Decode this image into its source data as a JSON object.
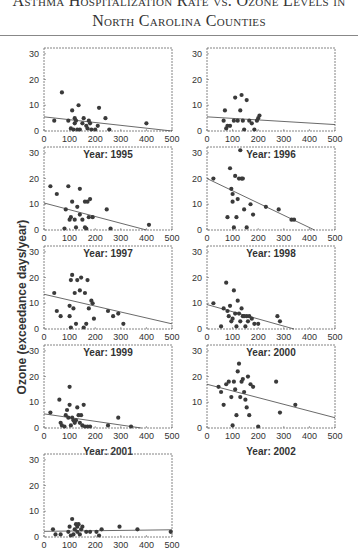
{
  "header": {
    "title_line1": "Asthma Hospitalization Rate vs. Ozone Levels in",
    "title_line2": "North Carolina Counties"
  },
  "y_axis_label": "Ozone (exceedance days/year)",
  "chart_data": [
    {
      "type": "scatter",
      "title": "Year: 1995",
      "xlim": [
        0,
        500
      ],
      "ylim": [
        0,
        30
      ],
      "xticks": [
        0,
        100,
        200,
        300,
        400,
        500
      ],
      "yticks": [
        0,
        10,
        20,
        30
      ],
      "points": [
        [
          40,
          4
        ],
        [
          70,
          15
        ],
        [
          95,
          4
        ],
        [
          105,
          1
        ],
        [
          110,
          8
        ],
        [
          115,
          0
        ],
        [
          120,
          3
        ],
        [
          120,
          5
        ],
        [
          125,
          4
        ],
        [
          130,
          0
        ],
        [
          135,
          10
        ],
        [
          140,
          0
        ],
        [
          150,
          3
        ],
        [
          155,
          5
        ],
        [
          165,
          2
        ],
        [
          170,
          1
        ],
        [
          175,
          4
        ],
        [
          180,
          3
        ],
        [
          185,
          0
        ],
        [
          200,
          0
        ],
        [
          210,
          2
        ],
        [
          215,
          9
        ],
        [
          240,
          5
        ],
        [
          255,
          0
        ],
        [
          400,
          3
        ]
      ],
      "trend": [
        [
          0,
          5.5
        ],
        [
          500,
          0
        ]
      ]
    },
    {
      "type": "scatter",
      "title": "Year: 1996",
      "xlim": [
        0,
        500
      ],
      "ylim": [
        0,
        30
      ],
      "xticks": [
        0,
        100,
        200,
        300,
        400,
        500
      ],
      "yticks": [
        0,
        10,
        20,
        30
      ],
      "points": [
        [
          65,
          4
        ],
        [
          70,
          8
        ],
        [
          75,
          1
        ],
        [
          80,
          2
        ],
        [
          90,
          2
        ],
        [
          105,
          4
        ],
        [
          110,
          13
        ],
        [
          120,
          4
        ],
        [
          130,
          8
        ],
        [
          135,
          14
        ],
        [
          140,
          4
        ],
        [
          145,
          0
        ],
        [
          155,
          12
        ],
        [
          165,
          4
        ],
        [
          175,
          3
        ],
        [
          185,
          0
        ],
        [
          195,
          4
        ],
        [
          200,
          5
        ],
        [
          205,
          6
        ]
      ],
      "trend": [
        [
          0,
          5.5
        ],
        [
          500,
          2.5
        ]
      ]
    },
    {
      "type": "scatter",
      "title": "Year: 1997",
      "xlim": [
        0,
        500
      ],
      "ylim": [
        0,
        30
      ],
      "xticks": [
        0,
        100,
        200,
        300,
        400,
        500
      ],
      "yticks": [
        0,
        10,
        20,
        30
      ],
      "points": [
        [
          25,
          17
        ],
        [
          50,
          14
        ],
        [
          80,
          0
        ],
        [
          85,
          8
        ],
        [
          95,
          17
        ],
        [
          100,
          4
        ],
        [
          105,
          5
        ],
        [
          110,
          11
        ],
        [
          120,
          4
        ],
        [
          125,
          1
        ],
        [
          130,
          9
        ],
        [
          140,
          6
        ],
        [
          140,
          16
        ],
        [
          150,
          4
        ],
        [
          160,
          1
        ],
        [
          160,
          11
        ],
        [
          165,
          0
        ],
        [
          170,
          11
        ],
        [
          175,
          5
        ],
        [
          180,
          12
        ],
        [
          190,
          5
        ],
        [
          245,
          8
        ],
        [
          260,
          0
        ],
        [
          410,
          2
        ]
      ],
      "trend": [
        [
          0,
          10.5
        ],
        [
          400,
          0
        ]
      ]
    },
    {
      "type": "scatter",
      "title": "Year: 1998",
      "xlim": [
        0,
        500
      ],
      "ylim": [
        0,
        30
      ],
      "xticks": [
        0,
        100,
        200,
        300,
        400,
        500
      ],
      "yticks": [
        0,
        10,
        20,
        30
      ],
      "points": [
        [
          25,
          20
        ],
        [
          80,
          5
        ],
        [
          90,
          24
        ],
        [
          95,
          16
        ],
        [
          100,
          11
        ],
        [
          100,
          14
        ],
        [
          105,
          1
        ],
        [
          110,
          21
        ],
        [
          115,
          5
        ],
        [
          120,
          12
        ],
        [
          125,
          20
        ],
        [
          130,
          31
        ],
        [
          135,
          20
        ],
        [
          140,
          20
        ],
        [
          145,
          8
        ],
        [
          155,
          1
        ],
        [
          170,
          10
        ],
        [
          180,
          6
        ],
        [
          230,
          9
        ],
        [
          280,
          8
        ],
        [
          330,
          4
        ],
        [
          340,
          4
        ]
      ],
      "trend": [
        [
          0,
          20
        ],
        [
          420,
          0
        ]
      ]
    },
    {
      "type": "scatter",
      "title": "Year: 1999",
      "xlim": [
        0,
        500
      ],
      "ylim": [
        0,
        30
      ],
      "xticks": [
        0,
        100,
        200,
        300,
        400,
        500
      ],
      "yticks": [
        0,
        10,
        20,
        30
      ],
      "points": [
        [
          40,
          14
        ],
        [
          50,
          7
        ],
        [
          65,
          5
        ],
        [
          100,
          9
        ],
        [
          100,
          5
        ],
        [
          105,
          0
        ],
        [
          105,
          19
        ],
        [
          110,
          21
        ],
        [
          115,
          8
        ],
        [
          120,
          14
        ],
        [
          125,
          2
        ],
        [
          130,
          19
        ],
        [
          140,
          15
        ],
        [
          145,
          20
        ],
        [
          155,
          0
        ],
        [
          160,
          14
        ],
        [
          165,
          2
        ],
        [
          170,
          19
        ],
        [
          175,
          8
        ],
        [
          185,
          11
        ],
        [
          190,
          10
        ],
        [
          195,
          4
        ],
        [
          250,
          7
        ],
        [
          270,
          5
        ],
        [
          290,
          6
        ],
        [
          310,
          2
        ]
      ],
      "trend": [
        [
          0,
          13.5
        ],
        [
          500,
          2
        ]
      ]
    },
    {
      "type": "scatter",
      "title": "Year: 2000",
      "xlim": [
        0,
        500
      ],
      "ylim": [
        0,
        30
      ],
      "xticks": [
        0,
        100,
        200,
        300,
        400,
        500
      ],
      "yticks": [
        0,
        10,
        20,
        30
      ],
      "points": [
        [
          25,
          10
        ],
        [
          55,
          1
        ],
        [
          65,
          8
        ],
        [
          75,
          18
        ],
        [
          80,
          7
        ],
        [
          85,
          5
        ],
        [
          90,
          9
        ],
        [
          95,
          3
        ],
        [
          100,
          4
        ],
        [
          105,
          15
        ],
        [
          110,
          6
        ],
        [
          115,
          1
        ],
        [
          120,
          11
        ],
        [
          125,
          6
        ],
        [
          130,
          3
        ],
        [
          135,
          8
        ],
        [
          140,
          5
        ],
        [
          145,
          5
        ],
        [
          150,
          1
        ],
        [
          155,
          5
        ],
        [
          160,
          3
        ],
        [
          165,
          5
        ],
        [
          175,
          4
        ],
        [
          185,
          2
        ],
        [
          200,
          2
        ],
        [
          275,
          5
        ],
        [
          285,
          3
        ]
      ],
      "trend": [
        [
          0,
          9.5
        ],
        [
          340,
          0
        ]
      ]
    },
    {
      "type": "scatter",
      "title": "Year: 2001",
      "xlim": [
        0,
        500
      ],
      "ylim": [
        0,
        30
      ],
      "xticks": [
        0,
        100,
        200,
        300,
        400,
        500
      ],
      "yticks": [
        0,
        10,
        20,
        30
      ],
      "points": [
        [
          25,
          6
        ],
        [
          60,
          11
        ],
        [
          65,
          2
        ],
        [
          70,
          1
        ],
        [
          80,
          0
        ],
        [
          85,
          5
        ],
        [
          90,
          7
        ],
        [
          95,
          4
        ],
        [
          100,
          16
        ],
        [
          100,
          9
        ],
        [
          105,
          1
        ],
        [
          110,
          4
        ],
        [
          115,
          3
        ],
        [
          120,
          2
        ],
        [
          125,
          3
        ],
        [
          130,
          8
        ],
        [
          135,
          5
        ],
        [
          140,
          2
        ],
        [
          145,
          5
        ],
        [
          150,
          1
        ],
        [
          155,
          9
        ],
        [
          160,
          0
        ],
        [
          170,
          0
        ],
        [
          180,
          0
        ],
        [
          250,
          1
        ],
        [
          290,
          4
        ],
        [
          340,
          0
        ]
      ],
      "trend": [
        [
          0,
          5.5
        ],
        [
          380,
          0
        ]
      ]
    },
    {
      "type": "scatter",
      "title": "Year: 2002",
      "xlim": [
        0,
        500
      ],
      "ylim": [
        0,
        30
      ],
      "xticks": [
        0,
        100,
        200,
        300,
        400,
        500
      ],
      "yticks": [
        0,
        10,
        20,
        30
      ],
      "points": [
        [
          45,
          16
        ],
        [
          55,
          14
        ],
        [
          65,
          9
        ],
        [
          75,
          17
        ],
        [
          85,
          18
        ],
        [
          95,
          12
        ],
        [
          100,
          1
        ],
        [
          105,
          18
        ],
        [
          110,
          15
        ],
        [
          115,
          5
        ],
        [
          120,
          22
        ],
        [
          125,
          25
        ],
        [
          130,
          12
        ],
        [
          135,
          18
        ],
        [
          140,
          19
        ],
        [
          145,
          14
        ],
        [
          150,
          11
        ],
        [
          155,
          8
        ],
        [
          160,
          20
        ],
        [
          165,
          5
        ],
        [
          170,
          17
        ],
        [
          180,
          16
        ],
        [
          200,
          0
        ],
        [
          270,
          18
        ],
        [
          285,
          6
        ],
        [
          345,
          9
        ]
      ],
      "trend": [
        [
          0,
          17
        ],
        [
          500,
          4
        ]
      ]
    },
    {
      "type": "scatter",
      "title": "Year: 2003",
      "xlim": [
        0,
        500
      ],
      "ylim": [
        0,
        30
      ],
      "xticks": [
        0,
        100,
        200,
        300,
        400,
        500
      ],
      "yticks": [
        0,
        10,
        20,
        30
      ],
      "points": [
        [
          35,
          3
        ],
        [
          45,
          1
        ],
        [
          65,
          1
        ],
        [
          95,
          2
        ],
        [
          100,
          4
        ],
        [
          105,
          0
        ],
        [
          110,
          7
        ],
        [
          115,
          1
        ],
        [
          120,
          3
        ],
        [
          125,
          5
        ],
        [
          130,
          2
        ],
        [
          130,
          4
        ],
        [
          135,
          5
        ],
        [
          140,
          1
        ],
        [
          145,
          3
        ],
        [
          150,
          4
        ],
        [
          165,
          2
        ],
        [
          180,
          2
        ],
        [
          205,
          2
        ],
        [
          215,
          0
        ],
        [
          225,
          3
        ],
        [
          295,
          4
        ],
        [
          365,
          3
        ],
        [
          495,
          2
        ]
      ],
      "trend": [
        [
          0,
          2.2
        ],
        [
          500,
          2.8
        ]
      ]
    }
  ],
  "colors": {
    "point": "#3a3a3a",
    "line": "#444444",
    "frame": "#666666",
    "text": "#333333"
  }
}
